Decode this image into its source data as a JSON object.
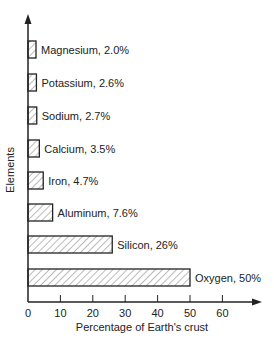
{
  "chart_data": {
    "type": "bar",
    "orientation": "horizontal",
    "title": "",
    "xlabel": "Percentage of Earth's crust",
    "ylabel": "Elements",
    "xlim": [
      0,
      70
    ],
    "xticks": [
      "0",
      "10",
      "20",
      "30",
      "40",
      "50",
      "60"
    ],
    "grid": false,
    "legend": null,
    "bar_style": "hatched",
    "categories": [
      "Magnesium",
      "Potassium",
      "Sodium",
      "Calcium",
      "Iron",
      "Aluminum",
      "Silicon",
      "Oxygen"
    ],
    "values": [
      2.0,
      2.6,
      2.7,
      3.5,
      4.7,
      7.6,
      26,
      50
    ],
    "data_labels": [
      "Magnesium, 2.0%",
      "Potassium, 2.6%",
      "Sodium, 2.7%",
      "Calcium, 3.5%",
      "Iron, 4.7%",
      "Aluminum, 7.6%",
      "Silicon, 26%",
      "Oxygen, 50%"
    ]
  }
}
